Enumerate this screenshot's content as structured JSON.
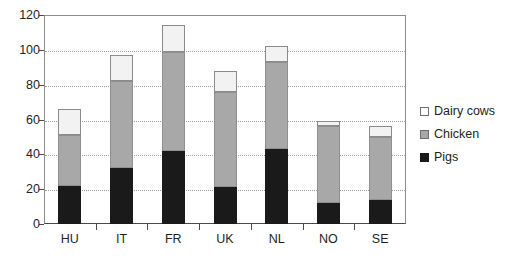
{
  "chart_data": {
    "type": "bar",
    "subtype": "stacked-vertical",
    "title": "",
    "xlabel": "",
    "ylabel": "",
    "categories": [
      "HU",
      "IT",
      "FR",
      "UK",
      "NL",
      "NO",
      "SE"
    ],
    "series": [
      {
        "name": "Pigs",
        "color": "#1a1a1a",
        "values": [
          22,
          32,
          42,
          21,
          43,
          12,
          14
        ]
      },
      {
        "name": "Chicken",
        "color": "#a8a8a8",
        "values": [
          29,
          50,
          57,
          55,
          50,
          44,
          36
        ]
      },
      {
        "name": "Dairy cows",
        "color": "#ffffff",
        "values": [
          15,
          15,
          15,
          12,
          9,
          3,
          6
        ]
      }
    ],
    "totals": [
      66,
      97,
      114,
      88,
      102,
      59,
      56
    ],
    "ylim": [
      0,
      120
    ],
    "yticks": [
      0,
      20,
      40,
      60,
      80,
      100,
      120
    ],
    "ytick_labels": [
      "0",
      "20",
      "40",
      "60",
      "80",
      "100",
      "120"
    ],
    "grid": true,
    "grid_axis": "y",
    "legend_position": "right",
    "legend_entries": [
      "Dairy cows",
      "Chicken",
      "Pigs"
    ]
  },
  "legend": {
    "items": [
      {
        "label": "Dairy cows",
        "swatch": "dairy"
      },
      {
        "label": "Chicken",
        "swatch": "chicken"
      },
      {
        "label": "Pigs",
        "swatch": "pigs"
      }
    ]
  }
}
